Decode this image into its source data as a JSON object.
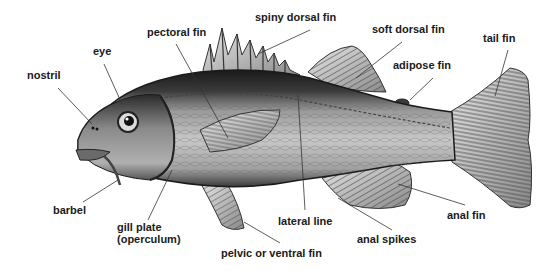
{
  "diagram": {
    "labels": {
      "nostril": "nostril",
      "eye": "eye",
      "pectoral_fin": "pectoral fin",
      "spiny_dorsal_fin": "spiny dorsal fin",
      "soft_dorsal_fin": "soft dorsal fin",
      "adipose_fin": "adipose fin",
      "tail_fin": "tail fin",
      "barbel": "barbel",
      "gill_plate": "gill plate\n(operculum)",
      "pelvic_fin": "pelvic or ventral fin",
      "lateral_line": "lateral line",
      "anal_spikes": "anal spikes",
      "anal_fin": "anal fin"
    },
    "colors": {
      "background": "#ffffff",
      "label_text": "#1a1a1a",
      "leader_line": "#333333",
      "fish_dark": "#1e1e1e",
      "fish_mid": "#7a7a7a",
      "fish_light": "#d8d8d8"
    }
  }
}
